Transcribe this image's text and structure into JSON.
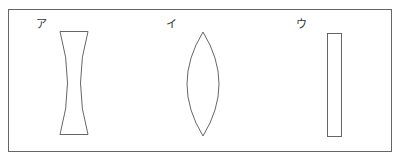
{
  "labels": {
    "a": "ア",
    "i": "イ",
    "u": "ウ"
  },
  "figures": [
    {
      "label": "ア",
      "shape": "concave-lens"
    },
    {
      "label": "イ",
      "shape": "convex-lens"
    },
    {
      "label": "ウ",
      "shape": "rectangular-glass-plate"
    }
  ],
  "colors": {
    "stroke": "#555555",
    "frame": "#666666",
    "background": "#ffffff"
  }
}
